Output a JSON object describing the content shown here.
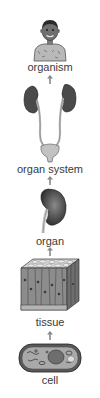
{
  "diagram": {
    "direction": "bottom-to-top",
    "levels": [
      {
        "id": "organism",
        "label": "organism",
        "illustration": "child-figure"
      },
      {
        "id": "organ-system",
        "label": "organ system",
        "illustration": "urinary-system"
      },
      {
        "id": "organ",
        "label": "organ",
        "illustration": "kidney"
      },
      {
        "id": "tissue",
        "label": "tissue",
        "illustration": "epithelial-tissue-block"
      },
      {
        "id": "cell",
        "label": "cell",
        "illustration": "cell"
      }
    ],
    "arrows": [
      {
        "from": "cell",
        "to": "tissue",
        "icon": "up-arrow-icon"
      },
      {
        "from": "tissue",
        "to": "organ",
        "icon": "up-arrow-icon"
      },
      {
        "from": "organ",
        "to": "organ-system",
        "icon": "up-arrow-icon"
      },
      {
        "from": "organ-system",
        "to": "organism",
        "icon": "up-arrow-icon"
      }
    ],
    "colors": {
      "text": "#3a3a3a",
      "illustration_dark": "#2e2e2e",
      "illustration_mid": "#7a7a7a",
      "illustration_light": "#c8c8c8"
    }
  }
}
